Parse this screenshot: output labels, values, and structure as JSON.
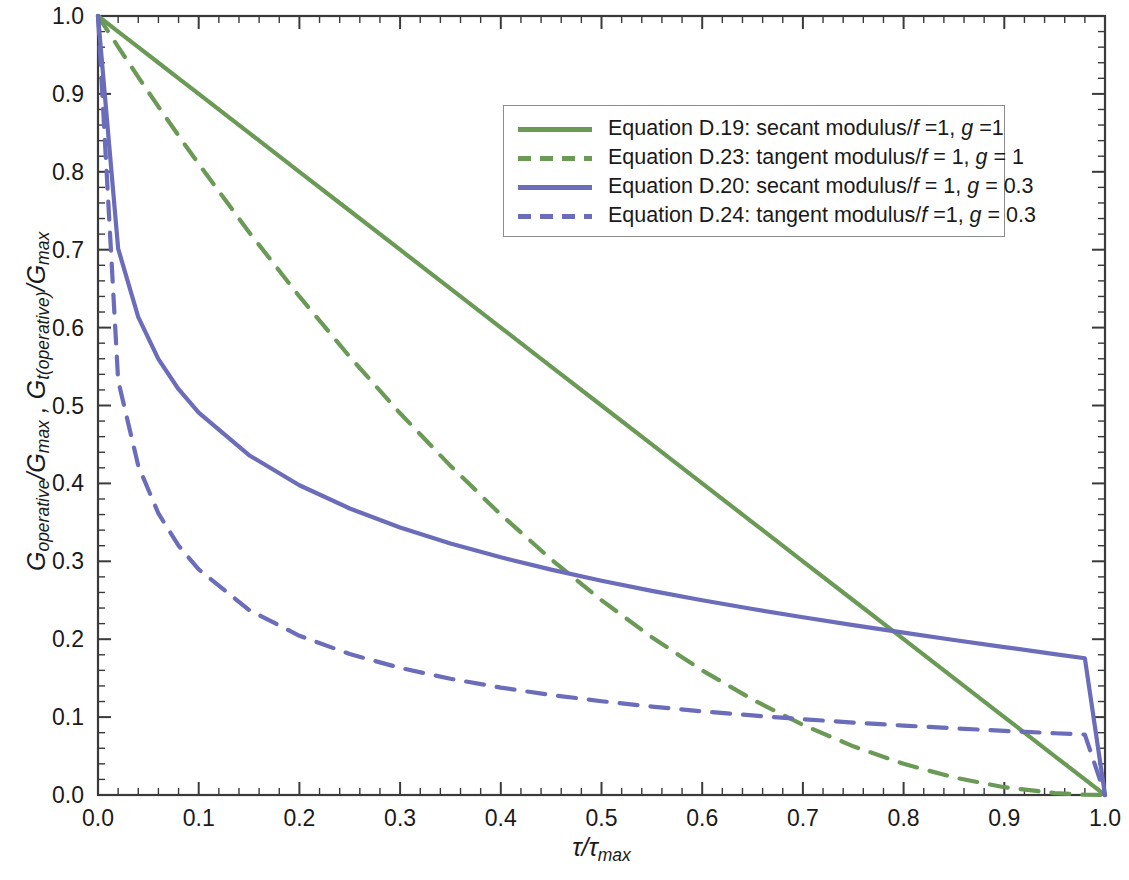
{
  "chart_data": {
    "type": "line",
    "title": "",
    "xlabel": "τ/τmax",
    "ylabel": "Goperative/Gmax , Gt(operative)/Gmax",
    "xlim": [
      0.0,
      1.0
    ],
    "ylim": [
      0.0,
      1.0
    ],
    "grid": false,
    "legend_position": "upper-right-inside",
    "x_ticks": [
      "0.0",
      "0.1",
      "0.2",
      "0.3",
      "0.4",
      "0.5",
      "0.6",
      "0.7",
      "0.8",
      "0.9",
      "1.0"
    ],
    "y_ticks": [
      "0.0",
      "0.1",
      "0.2",
      "0.3",
      "0.4",
      "0.5",
      "0.6",
      "0.7",
      "0.8",
      "0.9",
      "1.0"
    ],
    "x_tick_values": [
      0.0,
      0.1,
      0.2,
      0.3,
      0.4,
      0.5,
      0.6,
      0.7,
      0.8,
      0.9,
      1.0
    ],
    "y_tick_values": [
      0.0,
      0.1,
      0.2,
      0.3,
      0.4,
      0.5,
      0.6,
      0.7,
      0.8,
      0.9,
      1.0
    ],
    "minor_ticks_per_major": 5,
    "x": [
      0.0,
      0.02,
      0.04,
      0.06,
      0.08,
      0.1,
      0.15,
      0.2,
      0.25,
      0.3,
      0.35,
      0.4,
      0.45,
      0.5,
      0.55,
      0.6,
      0.65,
      0.7,
      0.75,
      0.8,
      0.85,
      0.9,
      0.95,
      0.98,
      1.0
    ],
    "series": [
      {
        "name": "Equation D.19: secant modulus/f =1, g =1",
        "color": "#6a9a55",
        "style": "solid",
        "values": [
          1.0,
          0.98,
          0.96,
          0.94,
          0.92,
          0.9,
          0.85,
          0.8,
          0.75,
          0.7,
          0.65,
          0.6,
          0.55,
          0.5,
          0.45,
          0.4,
          0.35,
          0.3,
          0.25,
          0.2,
          0.15,
          0.1,
          0.05,
          0.02,
          0.0
        ]
      },
      {
        "name": "Equation D.23: tangent modulus/f = 1, g = 1",
        "color": "#6a9a55",
        "style": "dashed",
        "values": [
          1.0,
          0.9604,
          0.9216,
          0.8836,
          0.8464,
          0.81,
          0.7225,
          0.64,
          0.5625,
          0.49,
          0.4225,
          0.36,
          0.3025,
          0.25,
          0.2025,
          0.16,
          0.1225,
          0.09,
          0.0625,
          0.04,
          0.0225,
          0.01,
          0.0025,
          0.0004,
          0.0
        ]
      },
      {
        "name": "Equation D.20: secant modulus/f = 1, g = 0.3",
        "color": "#6b6cba",
        "style": "solid",
        "values": [
          1.0,
          0.7014,
          0.6134,
          0.5596,
          0.5209,
          0.4908,
          0.4362,
          0.3976,
          0.3678,
          0.3435,
          0.3229,
          0.3051,
          0.2893,
          0.275,
          0.262,
          0.25,
          0.2388,
          0.2282,
          0.2181,
          0.2084,
          0.199,
          0.1899,
          0.1809,
          0.1755,
          0.0
        ]
      },
      {
        "name": "Equation D.24: tangent modulus/f =1, g = 0.3",
        "color": "#6b6cba",
        "style": "dashed",
        "values": [
          1.0,
          0.5322,
          0.4225,
          0.3614,
          0.3201,
          0.2896,
          0.2376,
          0.2044,
          0.1809,
          0.1632,
          0.1492,
          0.1378,
          0.1284,
          0.1204,
          0.1135,
          0.1074,
          0.1021,
          0.0973,
          0.093,
          0.0891,
          0.0856,
          0.0823,
          0.0793,
          0.0776,
          0.0
        ]
      }
    ]
  },
  "axes": {
    "xlabel_parts": {
      "tau": "τ",
      "slash": "/",
      "tau2": "τ",
      "sub": "max"
    },
    "ylabel_parts": {
      "g1": "G",
      "sub1": "operative",
      "slash1": "/",
      "g2": "G",
      "sub2": "max",
      "comma": " , ",
      "g3": "G",
      "sub3": "t(operative)",
      "slash2": "/",
      "g4": "G",
      "sub4": "max"
    }
  },
  "legend": {
    "items": [
      {
        "label_pre": "Equation D.19: secant modulus/",
        "f": "f",
        "mid": " =1, ",
        "g": "g",
        "post": " =1",
        "color": "#6a9a55",
        "style": "solid"
      },
      {
        "label_pre": "Equation D.23: tangent modulus/",
        "f": "f",
        "mid": " = 1, ",
        "g": "g",
        "post": " = 1",
        "color": "#6a9a55",
        "style": "dashed"
      },
      {
        "label_pre": "Equation D.20: secant modulus/",
        "f": "f",
        "mid": " = 1, ",
        "g": "g",
        "post": " = 0.3",
        "color": "#6b6cba",
        "style": "solid"
      },
      {
        "label_pre": "Equation D.24: tangent modulus/",
        "f": "f",
        "mid": " =1, ",
        "g": "g",
        "post": " = 0.3",
        "color": "#6b6cba",
        "style": "dashed"
      }
    ]
  },
  "colors": {
    "green": "#6a9a55",
    "blue": "#6b6cba",
    "axis": "#3a3a3a",
    "text": "#1a1a1a",
    "background": "#ffffff"
  }
}
